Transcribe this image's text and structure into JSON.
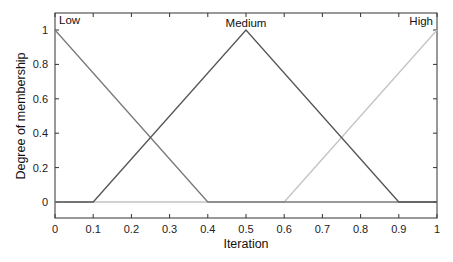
{
  "chart_data": {
    "type": "line",
    "title": "",
    "xlabel": "Iteration",
    "ylabel": "Degree of membership",
    "xlim": [
      0,
      1
    ],
    "ylim": [
      -0.1,
      1.1
    ],
    "grid": false,
    "legend": "none (inline curve labels)",
    "x_ticks": [
      "0",
      "0.1",
      "0.2",
      "0.3",
      "0.4",
      "0.5",
      "0.6",
      "0.7",
      "0.8",
      "0.9",
      "1"
    ],
    "y_ticks": [
      "0",
      "0.2",
      "0.4",
      "0.6",
      "0.8",
      "1"
    ],
    "series": [
      {
        "name": "Low",
        "color": "#7a7a7a",
        "x": [
          0,
          0.4,
          1
        ],
        "y": [
          1,
          0,
          0
        ]
      },
      {
        "name": "Medium",
        "color": "#555555",
        "x": [
          0,
          0.1,
          0.5,
          0.9,
          1
        ],
        "y": [
          0,
          0,
          1,
          0,
          0
        ]
      },
      {
        "name": "High",
        "color": "#c4c4c4",
        "x": [
          0,
          0.6,
          1
        ],
        "y": [
          0,
          0,
          1
        ]
      }
    ],
    "annotations": [
      {
        "text": "Low",
        "x": 0,
        "y": 1,
        "position": "top-left"
      },
      {
        "text": "Medium",
        "x": 0.5,
        "y": 1,
        "position": "top-center"
      },
      {
        "text": "High",
        "x": 1,
        "y": 1,
        "position": "top-right"
      }
    ]
  },
  "labels": {
    "xlabel": "Iteration",
    "ylabel": "Degree of membership",
    "low": "Low",
    "medium": "Medium",
    "high": "High"
  }
}
